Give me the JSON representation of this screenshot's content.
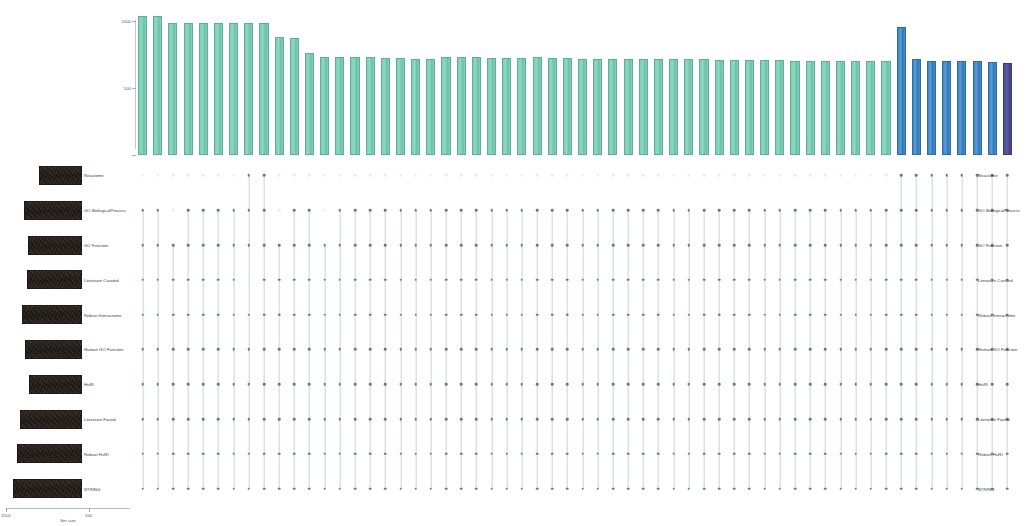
{
  "figure": {
    "type": "upset-plot",
    "colors": {
      "teal": "#7ecfb4",
      "blue": "#3f86c6",
      "purple": "#4b4b8f",
      "set_bar": "#241d19",
      "dot_on": "#6f7784",
      "dot_off": "#e9ecef",
      "connector": "#b9c6ce"
    }
  },
  "chart_data": {
    "type": "bar",
    "title": "",
    "xlabel": "",
    "ylabel": "Intersection size",
    "ylim": [
      0,
      1100
    ],
    "grid": false,
    "legend": null,
    "categories": [
      "i1",
      "i2",
      "i3",
      "i4",
      "i5",
      "i6",
      "i7",
      "i8",
      "i9",
      "i10",
      "i11",
      "i12",
      "i13",
      "i14",
      "i15",
      "i16",
      "i17",
      "i18",
      "i19",
      "i20",
      "i21",
      "i22",
      "i23",
      "i24",
      "i25",
      "i26",
      "i27",
      "i28",
      "i29",
      "i30",
      "i31",
      "i32",
      "i33",
      "i34",
      "i35",
      "i36",
      "i37",
      "i38",
      "i39",
      "i40",
      "i41",
      "i42",
      "i43",
      "i44",
      "i45",
      "i46",
      "i47",
      "i48",
      "i49",
      "i50",
      "i51",
      "i52",
      "i53",
      "i54",
      "i55",
      "i56",
      "i57",
      "i58"
    ],
    "values": [
      1040,
      1040,
      990,
      985,
      985,
      985,
      985,
      985,
      985,
      880,
      875,
      760,
      735,
      730,
      730,
      730,
      725,
      725,
      720,
      715,
      735,
      730,
      730,
      725,
      725,
      725,
      730,
      725,
      725,
      720,
      720,
      720,
      720,
      715,
      715,
      715,
      715,
      715,
      710,
      710,
      710,
      710,
      710,
      705,
      705,
      705,
      705,
      700,
      700,
      700,
      960,
      715,
      705,
      700,
      700,
      700,
      695,
      690
    ],
    "bar_labels": [
      "1040",
      "1040",
      "990",
      "985",
      "985",
      "985",
      "985",
      "985",
      "985",
      "880",
      "875",
      "760",
      "735",
      "730",
      "730",
      "730",
      "725",
      "725",
      "720",
      "715",
      "735",
      "730",
      "730",
      "725",
      "725",
      "725",
      "730",
      "725",
      "725",
      "720",
      "720",
      "720",
      "720",
      "715",
      "715",
      "715",
      "715",
      "715",
      "710",
      "710",
      "710",
      "710",
      "710",
      "705",
      "705",
      "705",
      "705",
      "700",
      "700",
      "700",
      "960",
      "715",
      "705",
      "700",
      "700",
      "700",
      "695",
      "690"
    ],
    "bar_colors": [
      "teal",
      "teal",
      "teal",
      "teal",
      "teal",
      "teal",
      "teal",
      "teal",
      "teal",
      "teal",
      "teal",
      "teal",
      "teal",
      "teal",
      "teal",
      "teal",
      "teal",
      "teal",
      "teal",
      "teal",
      "teal",
      "teal",
      "teal",
      "teal",
      "teal",
      "teal",
      "teal",
      "teal",
      "teal",
      "teal",
      "teal",
      "teal",
      "teal",
      "teal",
      "teal",
      "teal",
      "teal",
      "teal",
      "teal",
      "teal",
      "teal",
      "teal",
      "teal",
      "teal",
      "teal",
      "teal",
      "teal",
      "teal",
      "teal",
      "teal",
      "blue",
      "blue",
      "blue",
      "blue",
      "blue",
      "blue",
      "blue",
      "purple"
    ],
    "yticks": [
      0,
      500,
      1000
    ],
    "ytick_labels": [
      "0",
      "500",
      "1000"
    ]
  },
  "sets": {
    "axis_title": "Set size",
    "axis_ticks": [
      "1500",
      "1000",
      "500",
      "0"
    ],
    "rows": [
      {
        "label": "Reactome",
        "right_label": "Reactome",
        "size": 560
      },
      {
        "label": "GO BiologicalProcess",
        "right_label": "GO BiologicalProcess",
        "size": 760
      },
      {
        "label": "GO Function",
        "right_label": "GO Function",
        "size": 700
      },
      {
        "label": "Literature Curated",
        "right_label": "Literature Curated",
        "size": 720
      },
      {
        "label": "Robust Interactome",
        "right_label": "Robust Interactome",
        "size": 780
      },
      {
        "label": "Human GO Function",
        "right_label": "Human GO Function",
        "size": 740
      },
      {
        "label": "HuRI",
        "right_label": "HuRI",
        "size": 690
      },
      {
        "label": "Literature Found",
        "right_label": "Literature Found",
        "size": 800
      },
      {
        "label": "Robust HuRI",
        "right_label": "Robust HuRI",
        "size": 840
      },
      {
        "label": "STRING",
        "right_label": "STRING",
        "size": 900
      }
    ],
    "membership": [
      [
        0,
        0,
        0,
        0,
        0,
        0,
        0,
        1,
        1,
        0,
        0,
        0,
        0,
        0,
        0,
        0,
        0,
        0,
        0,
        0,
        0,
        0,
        0,
        0,
        0,
        0,
        0,
        0,
        0,
        0,
        0,
        0,
        0,
        0,
        0,
        0,
        0,
        0,
        0,
        0,
        0,
        0,
        0,
        0,
        0,
        0,
        0,
        0,
        0,
        0,
        1,
        1,
        1,
        1,
        1,
        1,
        1,
        1
      ],
      [
        1,
        1,
        0,
        1,
        1,
        1,
        1,
        1,
        1,
        0,
        1,
        1,
        0,
        1,
        1,
        1,
        1,
        1,
        1,
        1,
        1,
        1,
        1,
        1,
        1,
        1,
        1,
        1,
        1,
        1,
        1,
        1,
        1,
        1,
        1,
        1,
        1,
        1,
        1,
        1,
        1,
        1,
        1,
        1,
        1,
        1,
        1,
        1,
        1,
        1,
        1,
        1,
        1,
        1,
        1,
        1,
        1,
        1
      ],
      [
        1,
        1,
        1,
        1,
        1,
        1,
        1,
        1,
        1,
        1,
        1,
        1,
        1,
        1,
        1,
        1,
        1,
        1,
        1,
        1,
        1,
        1,
        1,
        1,
        1,
        1,
        1,
        1,
        1,
        1,
        1,
        1,
        1,
        1,
        1,
        1,
        1,
        1,
        1,
        1,
        1,
        1,
        1,
        1,
        1,
        1,
        1,
        1,
        1,
        1,
        1,
        1,
        1,
        1,
        1,
        1,
        1,
        1
      ],
      [
        1,
        1,
        1,
        1,
        1,
        1,
        1,
        0,
        1,
        1,
        1,
        1,
        1,
        1,
        1,
        1,
        1,
        1,
        1,
        1,
        1,
        1,
        1,
        1,
        1,
        1,
        1,
        1,
        1,
        1,
        1,
        1,
        1,
        1,
        1,
        1,
        1,
        1,
        1,
        1,
        1,
        1,
        1,
        1,
        1,
        1,
        1,
        1,
        1,
        1,
        1,
        1,
        1,
        1,
        1,
        1,
        1,
        1
      ],
      [
        1,
        1,
        1,
        1,
        1,
        1,
        1,
        1,
        1,
        1,
        1,
        1,
        1,
        1,
        1,
        1,
        1,
        1,
        1,
        1,
        1,
        1,
        1,
        1,
        1,
        1,
        1,
        1,
        1,
        1,
        1,
        1,
        1,
        1,
        1,
        1,
        1,
        1,
        1,
        1,
        1,
        1,
        1,
        1,
        1,
        1,
        1,
        1,
        1,
        1,
        1,
        1,
        1,
        1,
        1,
        1,
        1,
        1
      ],
      [
        1,
        1,
        1,
        1,
        1,
        1,
        1,
        1,
        1,
        1,
        1,
        1,
        1,
        1,
        1,
        1,
        1,
        1,
        1,
        1,
        1,
        1,
        1,
        1,
        1,
        1,
        1,
        1,
        1,
        1,
        1,
        1,
        1,
        1,
        1,
        1,
        1,
        1,
        1,
        1,
        1,
        1,
        1,
        1,
        1,
        1,
        1,
        1,
        1,
        1,
        1,
        1,
        1,
        1,
        1,
        1,
        1,
        1
      ],
      [
        1,
        1,
        1,
        1,
        1,
        1,
        1,
        1,
        1,
        1,
        1,
        1,
        1,
        1,
        1,
        1,
        1,
        1,
        1,
        1,
        1,
        1,
        1,
        1,
        1,
        1,
        1,
        1,
        1,
        1,
        1,
        1,
        1,
        1,
        1,
        1,
        1,
        1,
        1,
        1,
        1,
        1,
        1,
        1,
        1,
        1,
        1,
        1,
        1,
        1,
        1,
        1,
        1,
        1,
        1,
        1,
        1,
        1
      ],
      [
        1,
        1,
        1,
        1,
        1,
        1,
        1,
        1,
        1,
        1,
        1,
        1,
        1,
        1,
        1,
        1,
        1,
        1,
        1,
        1,
        1,
        1,
        1,
        1,
        1,
        1,
        1,
        1,
        1,
        1,
        1,
        1,
        1,
        1,
        1,
        1,
        1,
        1,
        1,
        1,
        1,
        1,
        1,
        1,
        1,
        1,
        1,
        1,
        1,
        1,
        1,
        1,
        1,
        1,
        1,
        1,
        1,
        1
      ],
      [
        1,
        1,
        1,
        1,
        1,
        1,
        1,
        1,
        1,
        1,
        1,
        1,
        1,
        1,
        1,
        1,
        1,
        1,
        1,
        1,
        1,
        1,
        1,
        1,
        1,
        1,
        1,
        1,
        1,
        1,
        1,
        1,
        1,
        1,
        1,
        1,
        1,
        1,
        1,
        1,
        1,
        1,
        1,
        1,
        1,
        1,
        1,
        1,
        1,
        1,
        1,
        1,
        1,
        1,
        1,
        1,
        1,
        1
      ],
      [
        1,
        1,
        1,
        1,
        1,
        1,
        1,
        1,
        1,
        1,
        1,
        1,
        1,
        1,
        1,
        1,
        1,
        1,
        1,
        1,
        1,
        1,
        1,
        1,
        1,
        1,
        1,
        1,
        1,
        1,
        1,
        1,
        1,
        1,
        1,
        1,
        1,
        1,
        1,
        1,
        1,
        1,
        1,
        1,
        1,
        1,
        1,
        1,
        1,
        1,
        1,
        1,
        1,
        1,
        1,
        1,
        1,
        1
      ]
    ]
  }
}
